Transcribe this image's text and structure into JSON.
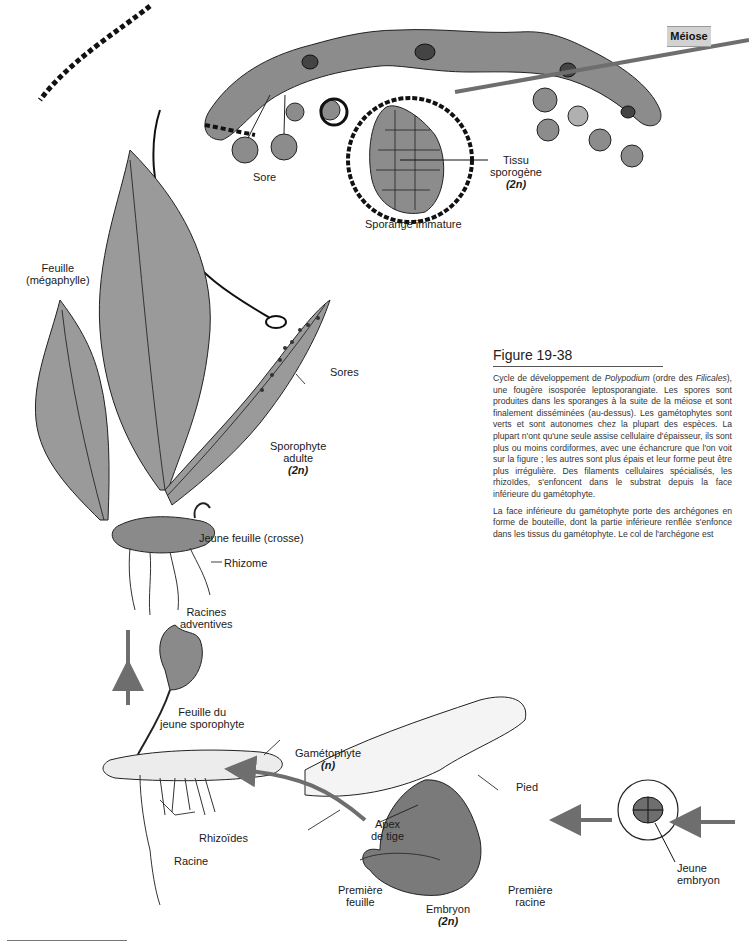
{
  "figure": {
    "number": "Figure 19-38",
    "stage_box": "Méiose"
  },
  "caption": {
    "p1_a": "Cycle de développement de ",
    "p1_genus": "Polypodium",
    "p1_b": " (ordre des ",
    "p1_order": "Filicales",
    "p1_c": "), une fougère isosporée leptosporangiate. Les spores sont produites dans les sporanges à la suite de la méiose et sont finalement disséminées (au-dessus). Les gamétophytes sont verts et sont autonomes chez la plupart des espèces. La plupart n'ont qu'une seule assise cellulaire d'épaisseur, ils sont plus ou moins cordiformes, avec une échancrure que l'on voit sur la figure ; les autres sont plus épais et leur forme peut être plus irrégulière. Des filaments cellulaires spécialisés, les rhizoïdes, s'enfoncent dans le substrat depuis la face inférieure du gamétophyte.",
    "p2": "La face inférieure du gamétophyte porte des archégones en forme de bouteille, dont la partie inférieure renflée s'enfonce dans les tissus du gamétophyte. Le col de l'archégone est"
  },
  "labels": {
    "sore": "Sore",
    "tissu_1": "Tissu",
    "tissu_2": "sporogène",
    "tissu_ploidy": "(2n)",
    "sporange": "Sporange immature",
    "feuille_1": "Feuille",
    "feuille_2": "(mégaphylle)",
    "sores": "Sores",
    "sporophyte_1": "Sporophyte",
    "sporophyte_2": "adulte",
    "sporophyte_ploidy": "(2n)",
    "jeune_feuille": "Jeune feuille (crosse)",
    "rhizome": "Rhizome",
    "racines_1": "Racines",
    "racines_2": "adventives",
    "feuille_du_1": "Feuille du",
    "feuille_du_2": "jeune sporophyte",
    "gametophyte": "Gamétophyte",
    "gametophyte_ploidy": "(n)",
    "pied": "Pied",
    "apex_1": "Apex",
    "apex_2": "de tige",
    "rhizoides": "Rhizoïdes",
    "racine": "Racine",
    "premiere_feuille_1": "Première",
    "premiere_feuille_2": "feuille",
    "embryon": "Embryon",
    "embryon_ploidy": "(2n)",
    "premiere_racine_1": "Première",
    "premiere_racine_2": "racine",
    "jeune_embryon_1": "Jeune",
    "jeune_embryon_2": "embryon"
  },
  "colors": {
    "tissue_gray": "#8a8a8a",
    "frond_gray": "#9a9a9a",
    "arrow_gray": "#6e6e6e",
    "meiose_box": "#d2d2d2"
  }
}
